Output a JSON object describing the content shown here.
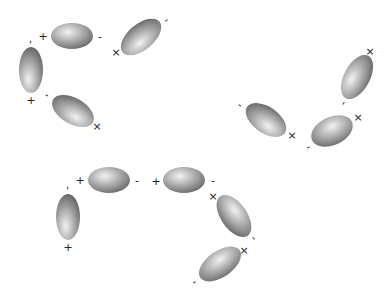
{
  "diagram": {
    "type": "dipole-chains",
    "colors": {
      "background": "#ffffff",
      "ellipsoid_highlight": "#f2f2f2",
      "ellipsoid_mid": "#b0b0b0",
      "ellipsoid_edge": "#5e5e5e",
      "label": "#222222"
    },
    "dipoles": [
      {
        "id": "d1",
        "cx": 72,
        "cy": 36,
        "rx": 21,
        "ry": 13,
        "angle": 0,
        "hx": 40,
        "hy": 35
      },
      {
        "id": "d2",
        "cx": 31,
        "cy": 70,
        "rx": 12,
        "ry": 23,
        "angle": 0,
        "hx": 40,
        "hy": 70
      },
      {
        "id": "d3",
        "cx": 141,
        "cy": 37,
        "rx": 24,
        "ry": 13,
        "angle": -40,
        "hx": 40,
        "hy": 65
      },
      {
        "id": "d4",
        "cx": 73,
        "cy": 111,
        "rx": 23,
        "ry": 13,
        "angle": 30,
        "hx": 62,
        "hy": 65
      },
      {
        "id": "d5",
        "cx": 266,
        "cy": 120,
        "rx": 23,
        "ry": 13,
        "angle": 35,
        "hx": 62,
        "hy": 65
      },
      {
        "id": "d6",
        "cx": 357,
        "cy": 77,
        "rx": 24,
        "ry": 13,
        "angle": -62,
        "hx": 40,
        "hy": 35
      },
      {
        "id": "d7",
        "cx": 332,
        "cy": 131,
        "rx": 22,
        "ry": 14,
        "angle": -25,
        "hx": 55,
        "hy": 35
      },
      {
        "id": "d8",
        "cx": 68,
        "cy": 217,
        "rx": 12,
        "ry": 23,
        "angle": 0,
        "hx": 40,
        "hy": 70
      },
      {
        "id": "d9",
        "cx": 109,
        "cy": 180,
        "rx": 21,
        "ry": 13,
        "angle": 0,
        "hx": 40,
        "hy": 35
      },
      {
        "id": "d10",
        "cx": 184,
        "cy": 180,
        "rx": 21,
        "ry": 13,
        "angle": 0,
        "hx": 40,
        "hy": 35
      },
      {
        "id": "d11",
        "cx": 234,
        "cy": 216,
        "rx": 24,
        "ry": 13,
        "angle": 55,
        "hx": 40,
        "hy": 35
      },
      {
        "id": "d12",
        "cx": 220,
        "cy": 264,
        "rx": 24,
        "ry": 13,
        "angle": -35,
        "hx": 55,
        "hy": 35
      }
    ],
    "labels": [
      {
        "text": "+",
        "x": 43,
        "y": 36,
        "size": 13
      },
      {
        "text": "-",
        "x": 100,
        "y": 36,
        "size": 11
      },
      {
        "text": "-",
        "x": 31,
        "y": 42,
        "size": 11,
        "rot": 90
      },
      {
        "text": "+",
        "x": 31,
        "y": 100,
        "size": 13
      },
      {
        "text": "×",
        "x": 116,
        "y": 52,
        "size": 13
      },
      {
        "text": "-",
        "x": 166,
        "y": 20,
        "size": 10,
        "rot": -40
      },
      {
        "text": "-",
        "x": 47,
        "y": 95,
        "size": 10,
        "rot": 30
      },
      {
        "text": "×",
        "x": 97,
        "y": 126,
        "size": 13
      },
      {
        "text": "-",
        "x": 240,
        "y": 105,
        "size": 10,
        "rot": 30
      },
      {
        "text": "×",
        "x": 292,
        "y": 135,
        "size": 13
      },
      {
        "text": "×",
        "x": 370,
        "y": 51,
        "size": 13
      },
      {
        "text": "-",
        "x": 343,
        "y": 103,
        "size": 10,
        "rot": -62
      },
      {
        "text": "×",
        "x": 358,
        "y": 117,
        "size": 13
      },
      {
        "text": "-",
        "x": 308,
        "y": 147,
        "size": 10,
        "rot": -25
      },
      {
        "text": "+",
        "x": 80,
        "y": 180,
        "size": 13
      },
      {
        "text": "-",
        "x": 137,
        "y": 180,
        "size": 11
      },
      {
        "text": "-",
        "x": 68,
        "y": 188,
        "size": 11,
        "rot": 90
      },
      {
        "text": "+",
        "x": 68,
        "y": 247,
        "size": 13
      },
      {
        "text": "+",
        "x": 156,
        "y": 181,
        "size": 13
      },
      {
        "text": "-",
        "x": 213,
        "y": 180,
        "size": 11
      },
      {
        "text": "×",
        "x": 213,
        "y": 196,
        "size": 12
      },
      {
        "text": "-",
        "x": 254,
        "y": 238,
        "size": 10,
        "rot": 55
      },
      {
        "text": "×",
        "x": 244,
        "y": 250,
        "size": 13
      },
      {
        "text": "-",
        "x": 194,
        "y": 282,
        "size": 10,
        "rot": -35
      }
    ]
  }
}
